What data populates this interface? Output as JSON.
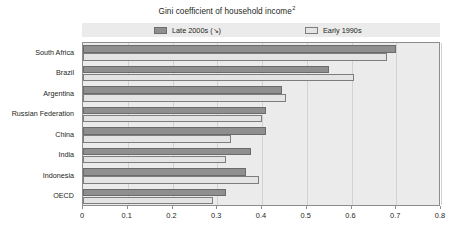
{
  "chart_data": {
    "type": "bar",
    "orientation": "horizontal",
    "title": "Gini coefficient of household income",
    "title_superscript": "2",
    "xlabel": "",
    "ylabel": "",
    "xlim": [
      0,
      0.8
    ],
    "xticks": [
      "0",
      "0.1",
      "0.2",
      "0.3",
      "0.4",
      "0.5",
      "0.6",
      "0.7",
      "0.8"
    ],
    "xtick_values": [
      0,
      0.1,
      0.2,
      0.3,
      0.4,
      0.5,
      0.6,
      0.7,
      0.8
    ],
    "grid": true,
    "legend_position": "top",
    "categories": [
      "South Africa",
      "Brazil",
      "Argentina",
      "Russian Federation",
      "China",
      "India",
      "Indonesia",
      "OECD"
    ],
    "series": [
      {
        "name": "Late 2000s",
        "name_suffix": "(↘)",
        "color": "#8f8f8f",
        "values": [
          0.7,
          0.55,
          0.445,
          0.41,
          0.41,
          0.375,
          0.365,
          0.32
        ]
      },
      {
        "name": "Early 1990s",
        "color": "#e4e4e4",
        "values": [
          0.68,
          0.605,
          0.453,
          0.4,
          0.33,
          0.32,
          0.394,
          0.29
        ]
      }
    ]
  },
  "legend": {
    "entries": [
      {
        "label": "Late 2000s (↘)"
      },
      {
        "label": "Early 1990s"
      }
    ]
  },
  "footnote": {
    "text": ""
  },
  "colors": {
    "series_dark": "#8f8f8f",
    "series_light": "#e4e4e4",
    "plot_background": "#ebebeb",
    "axis": "#8d8d8d"
  }
}
